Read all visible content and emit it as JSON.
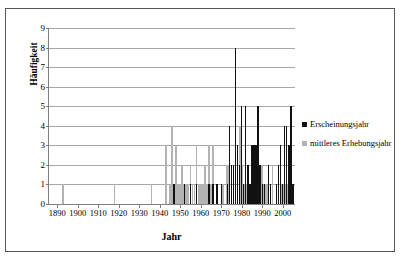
{
  "chart_data": {
    "type": "bar",
    "title": "",
    "xlabel": "Jahr",
    "ylabel": "Häufigkeit",
    "xlim": [
      1886,
      2006
    ],
    "ylim": [
      0,
      9
    ],
    "ytick_values": [
      0,
      1,
      2,
      3,
      4,
      5,
      6,
      7,
      8,
      9
    ],
    "xtick_values": [
      1890,
      1900,
      1910,
      1920,
      1930,
      1940,
      1950,
      1960,
      1970,
      1980,
      1990,
      2000
    ],
    "xtick_labels": [
      "1890",
      "1900",
      "1910",
      "1920",
      "1930",
      "1940",
      "1950",
      "1960",
      "1970",
      "1980",
      "1990",
      "2000"
    ],
    "grid": "horizontal",
    "legend_position": "right",
    "colors": {
      "Erscheinungsjahr": "#111111",
      "mittleres Erhebungsjahr": "#b3b3b3",
      "gridline": "#a8a8a8",
      "axis": "#808080",
      "frame": "#555555",
      "background": "#ffffff"
    },
    "series": [
      {
        "name": "mittleres Erhebungsjahr",
        "color": "#b3b3b3",
        "points": [
          {
            "x": 1893,
            "y": 1
          },
          {
            "x": 1918,
            "y": 1
          },
          {
            "x": 1936,
            "y": 1
          },
          {
            "x": 1943,
            "y": 3
          },
          {
            "x": 1945,
            "y": 1
          },
          {
            "x": 1946,
            "y": 4
          },
          {
            "x": 1948,
            "y": 3
          },
          {
            "x": 1949,
            "y": 1
          },
          {
            "x": 1950,
            "y": 1
          },
          {
            "x": 1951,
            "y": 2
          },
          {
            "x": 1952,
            "y": 1
          },
          {
            "x": 1953,
            "y": 1
          },
          {
            "x": 1954,
            "y": 1
          },
          {
            "x": 1955,
            "y": 2
          },
          {
            "x": 1956,
            "y": 1
          },
          {
            "x": 1957,
            "y": 1
          },
          {
            "x": 1958,
            "y": 3
          },
          {
            "x": 1959,
            "y": 1
          },
          {
            "x": 1960,
            "y": 1
          },
          {
            "x": 1961,
            "y": 1
          },
          {
            "x": 1962,
            "y": 2
          },
          {
            "x": 1963,
            "y": 1
          },
          {
            "x": 1964,
            "y": 3
          },
          {
            "x": 1965,
            "y": 1
          },
          {
            "x": 1966,
            "y": 3
          },
          {
            "x": 1968,
            "y": 1
          },
          {
            "x": 1971,
            "y": 1
          },
          {
            "x": 1973,
            "y": 2
          },
          {
            "x": 1974,
            "y": 2
          },
          {
            "x": 1975,
            "y": 2
          },
          {
            "x": 1976,
            "y": 2
          },
          {
            "x": 1977,
            "y": 2
          },
          {
            "x": 1978,
            "y": 1
          },
          {
            "x": 1979,
            "y": 4
          },
          {
            "x": 1980,
            "y": 2
          },
          {
            "x": 1981,
            "y": 1
          },
          {
            "x": 1982,
            "y": 1
          },
          {
            "x": 1983,
            "y": 2
          },
          {
            "x": 1984,
            "y": 1
          },
          {
            "x": 1985,
            "y": 2
          },
          {
            "x": 1986,
            "y": 3
          },
          {
            "x": 1987,
            "y": 3
          },
          {
            "x": 1988,
            "y": 3
          },
          {
            "x": 1989,
            "y": 2
          },
          {
            "x": 1990,
            "y": 2
          },
          {
            "x": 1991,
            "y": 1
          },
          {
            "x": 1992,
            "y": 1
          },
          {
            "x": 1993,
            "y": 1
          },
          {
            "x": 1995,
            "y": 2
          },
          {
            "x": 1999,
            "y": 1
          },
          {
            "x": 2000,
            "y": 1
          },
          {
            "x": 2001,
            "y": 1
          },
          {
            "x": 2002,
            "y": 1
          },
          {
            "x": 2003,
            "y": 1
          }
        ]
      },
      {
        "name": "Erscheinungsjahr",
        "color": "#111111",
        "points": [
          {
            "x": 1947,
            "y": 1
          },
          {
            "x": 1952,
            "y": 1
          },
          {
            "x": 1955,
            "y": 1
          },
          {
            "x": 1958,
            "y": 1
          },
          {
            "x": 1964,
            "y": 1
          },
          {
            "x": 1966,
            "y": 1
          },
          {
            "x": 1968,
            "y": 1
          },
          {
            "x": 1970,
            "y": 1
          },
          {
            "x": 1973,
            "y": 1
          },
          {
            "x": 1974,
            "y": 4
          },
          {
            "x": 1975,
            "y": 2
          },
          {
            "x": 1976,
            "y": 2
          },
          {
            "x": 1977,
            "y": 8
          },
          {
            "x": 1978,
            "y": 3
          },
          {
            "x": 1979,
            "y": 2
          },
          {
            "x": 1980,
            "y": 5
          },
          {
            "x": 1981,
            "y": 1
          },
          {
            "x": 1982,
            "y": 5
          },
          {
            "x": 1983,
            "y": 2
          },
          {
            "x": 1984,
            "y": 1
          },
          {
            "x": 1985,
            "y": 3
          },
          {
            "x": 1986,
            "y": 3
          },
          {
            "x": 1987,
            "y": 3
          },
          {
            "x": 1988,
            "y": 5
          },
          {
            "x": 1989,
            "y": 2
          },
          {
            "x": 1990,
            "y": 1
          },
          {
            "x": 1991,
            "y": 1
          },
          {
            "x": 1993,
            "y": 2
          },
          {
            "x": 1994,
            "y": 1
          },
          {
            "x": 1997,
            "y": 1
          },
          {
            "x": 1998,
            "y": 2
          },
          {
            "x": 1999,
            "y": 3
          },
          {
            "x": 2000,
            "y": 1
          },
          {
            "x": 2001,
            "y": 4
          },
          {
            "x": 2002,
            "y": 4
          },
          {
            "x": 2003,
            "y": 3
          },
          {
            "x": 2004,
            "y": 5
          },
          {
            "x": 2005,
            "y": 1
          }
        ]
      }
    ],
    "legend": [
      {
        "label": "Erscheinungsjahr",
        "color": "#111111"
      },
      {
        "label": "mittleres Erhebungsjahr",
        "color": "#b3b3b3"
      }
    ]
  }
}
